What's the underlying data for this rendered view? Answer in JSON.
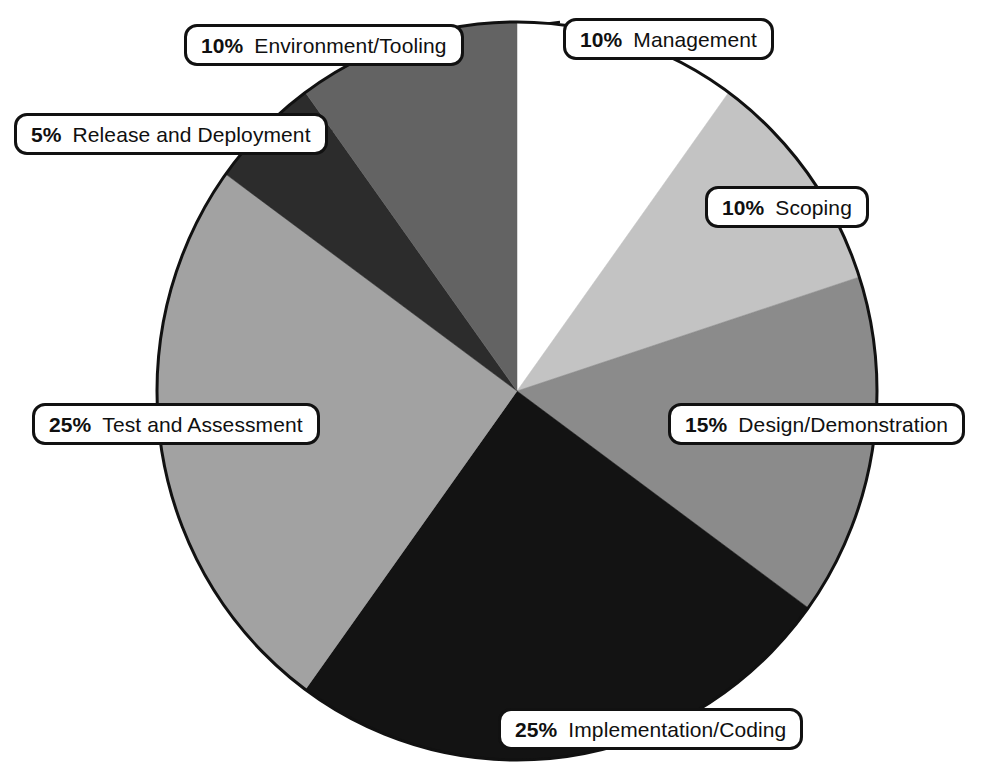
{
  "chart_data": {
    "type": "pie",
    "title": "",
    "subtitle": "",
    "xlabel": "",
    "ylabel": "",
    "legend_position": "callout-labels",
    "grid": false,
    "units": "percent",
    "total": 100,
    "start_angle_deg": 0,
    "direction": "clockwise",
    "categories": [
      "Management",
      "Scoping",
      "Design/Demonstration",
      "Implementation/Coding",
      "Test and Assessment",
      "Release and Deployment",
      "Environment/Tooling"
    ],
    "values": [
      10,
      10,
      15,
      25,
      25,
      5,
      10
    ],
    "slices": [
      {
        "label": "Management",
        "percent": 10,
        "percent_text": "10%",
        "color": "#ffffff",
        "start_deg": 0,
        "end_deg": 36
      },
      {
        "label": "Scoping",
        "percent": 10,
        "percent_text": "10%",
        "color": "#c3c3c3",
        "start_deg": 36,
        "end_deg": 72
      },
      {
        "label": "Design/Demonstration",
        "percent": 15,
        "percent_text": "15%",
        "color": "#8b8b8b",
        "start_deg": 72,
        "end_deg": 126
      },
      {
        "label": "Implementation/Coding",
        "percent": 25,
        "percent_text": "25%",
        "color": "#131313",
        "start_deg": 126,
        "end_deg": 216
      },
      {
        "label": "Test and Assessment",
        "percent": 25,
        "percent_text": "25%",
        "color": "#a2a2a2",
        "start_deg": 216,
        "end_deg": 306
      },
      {
        "label": "Release and Deployment",
        "percent": 5,
        "percent_text": "5%",
        "color": "#2c2c2c",
        "start_deg": 306,
        "end_deg": 324
      },
      {
        "label": "Environment/Tooling",
        "percent": 10,
        "percent_text": "10%",
        "color": "#636363",
        "start_deg": 324,
        "end_deg": 360
      }
    ]
  },
  "labels": {
    "management": {
      "pct": "10%",
      "name": "Management"
    },
    "scoping": {
      "pct": "10%",
      "name": "Scoping"
    },
    "design": {
      "pct": "15%",
      "name": "Design/Demonstration"
    },
    "implementation": {
      "pct": "25%",
      "name": "Implementation/Coding"
    },
    "test": {
      "pct": "25%",
      "name": "Test and Assessment"
    },
    "release": {
      "pct": "5%",
      "name": "Release and Deployment"
    },
    "environment": {
      "pct": "10%",
      "name": "Environment/Tooling"
    }
  },
  "colors": {
    "outline": "#111111",
    "background": "#ffffff",
    "text": "#101010"
  }
}
